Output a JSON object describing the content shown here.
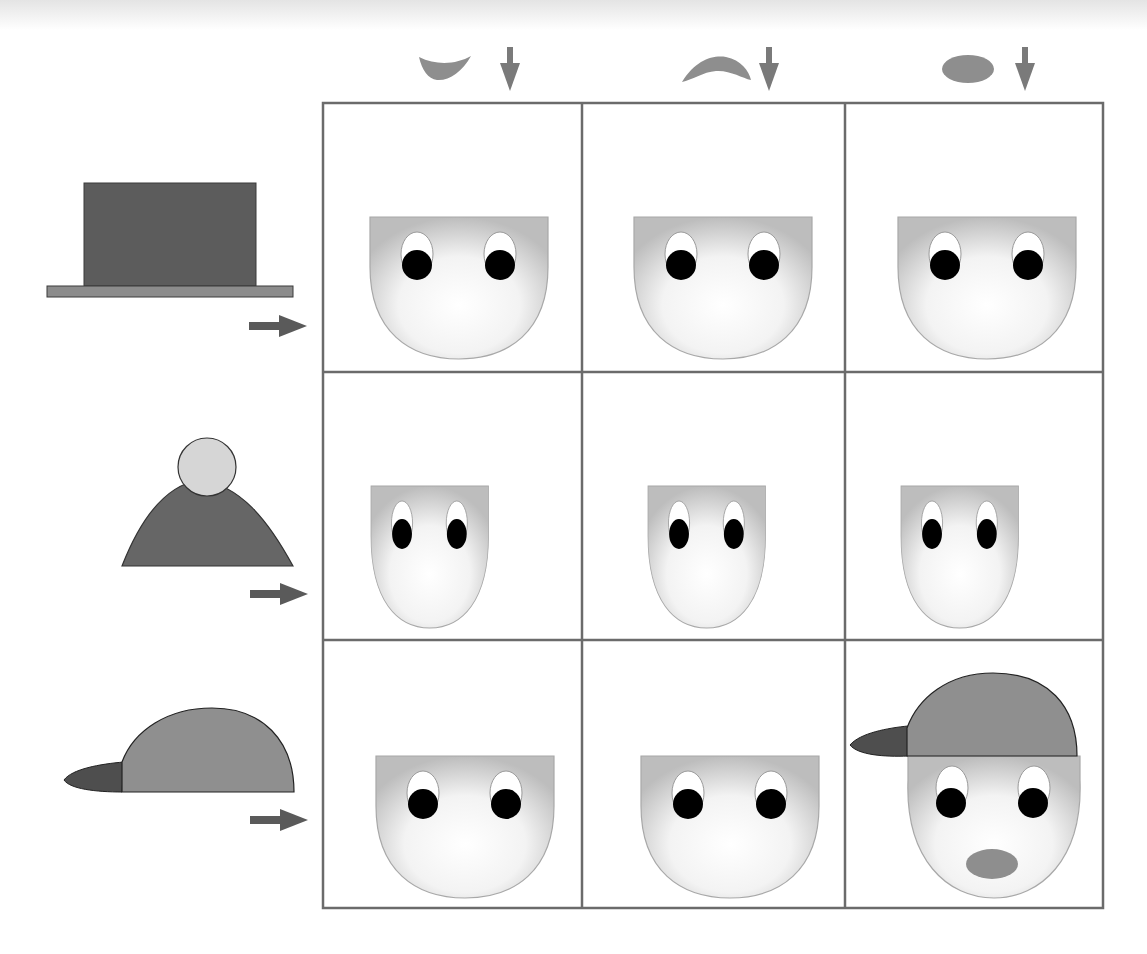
{
  "figure": {
    "type": "logic-grid-puzzle",
    "rows": 3,
    "cols": 3,
    "colors": {
      "grid_line": "#6b6b6b",
      "mouth_fill": "#8e8e8e",
      "arrow_fill": "#7a7a7a",
      "row_arrow_fill": "#5a5a5a",
      "top_hat_fill": "#5c5c5c",
      "top_hat_brim": "#8c8c8c",
      "bobble_hat_fill": "#666666",
      "bobble_fill": "#d6d6d6",
      "cap_crown_fill": "#8f8f8f",
      "cap_visor_fill": "#4e4e4e",
      "face_center": "#ffffff",
      "face_edge": "#bdbdbd",
      "pupil": "#000000"
    },
    "column_headers": [
      {
        "icon": "smile-mouth-icon",
        "arrow": "down-arrow-icon"
      },
      {
        "icon": "frown-mouth-icon",
        "arrow": "down-arrow-icon"
      },
      {
        "icon": "oval-mouth-icon",
        "arrow": "down-arrow-icon"
      }
    ],
    "row_headers": [
      {
        "icon": "top-hat-icon",
        "arrow": "right-arrow-icon"
      },
      {
        "icon": "bobble-hat-icon",
        "arrow": "right-arrow-icon"
      },
      {
        "icon": "baseball-cap-icon",
        "arrow": "right-arrow-icon"
      }
    ],
    "cells": [
      [
        {
          "hat": null,
          "mouth": null
        },
        {
          "hat": null,
          "mouth": null
        },
        {
          "hat": null,
          "mouth": null
        }
      ],
      [
        {
          "hat": null,
          "mouth": null
        },
        {
          "hat": null,
          "mouth": null
        },
        {
          "hat": null,
          "mouth": null
        }
      ],
      [
        {
          "hat": null,
          "mouth": null
        },
        {
          "hat": null,
          "mouth": null
        },
        {
          "hat": "baseball-cap",
          "mouth": "oval"
        }
      ]
    ]
  }
}
